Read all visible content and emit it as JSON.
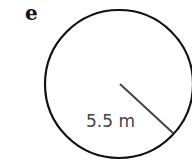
{
  "figure": {
    "part_label": "e",
    "shape": "circle",
    "radius_label": "5.5 m",
    "colors": {
      "outline": "#111111",
      "radius_line": "#444444",
      "text": "#444444"
    }
  }
}
